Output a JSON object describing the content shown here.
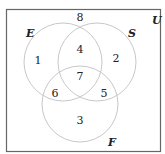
{
  "diagram": {
    "type": "venn-3-set",
    "universe": {
      "label": "U",
      "x": 152,
      "y": 24
    },
    "frame": {
      "x": 6.5,
      "y": 9.5,
      "width": 154,
      "height": 142,
      "stroke": "#666666"
    },
    "circle_stroke": "#c8c8c8",
    "sets": [
      {
        "label": "E",
        "cx": 63,
        "cy": 62,
        "r": 39,
        "label_x": 26,
        "label_y": 37
      },
      {
        "label": "S",
        "cx": 97,
        "cy": 62,
        "r": 39,
        "label_x": 128,
        "label_y": 37
      },
      {
        "label": "F",
        "cx": 80,
        "cy": 104,
        "r": 38,
        "label_x": 108,
        "label_y": 146
      }
    ],
    "regions": [
      {
        "id": "outside",
        "value": "8",
        "x": 80,
        "y": 21
      },
      {
        "id": "E-only",
        "value": "1",
        "x": 38,
        "y": 64
      },
      {
        "id": "E-and-S",
        "value": "4",
        "x": 80,
        "y": 53
      },
      {
        "id": "S-only",
        "value": "2",
        "x": 116,
        "y": 62
      },
      {
        "id": "E-S-F",
        "value": "7",
        "x": 80,
        "y": 80
      },
      {
        "id": "E-and-F",
        "value": "6",
        "x": 55,
        "y": 97
      },
      {
        "id": "S-and-F",
        "value": "5",
        "x": 104,
        "y": 97
      },
      {
        "id": "F-only",
        "value": "3",
        "x": 80,
        "y": 124
      }
    ]
  }
}
